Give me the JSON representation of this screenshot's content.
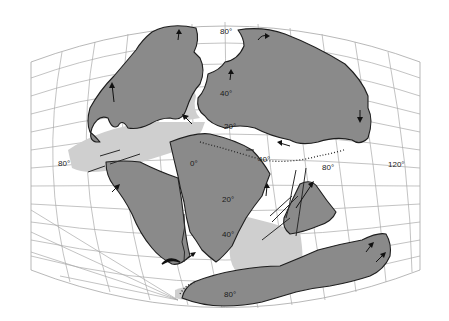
{
  "map": {
    "type": "paleogeographic reconstruction",
    "colors": {
      "background": "#ffffff",
      "land": "#8a8a8a",
      "shelf": "#cfcfcf",
      "grid": "#a9a9a9",
      "coastline": "#1e1e1e"
    },
    "labels": {
      "lat_80_north": "80°",
      "lat_40_north": "40°",
      "lat_20_north": "20°",
      "lat_0": "0°",
      "lat_20_south": "20°",
      "lat_40_south": "40°",
      "lat_80_south": "80°",
      "lon_80_west": "80°",
      "lon_40_mid": "40°",
      "lon_80_east": "80°",
      "lon_120_east": "120°"
    }
  }
}
